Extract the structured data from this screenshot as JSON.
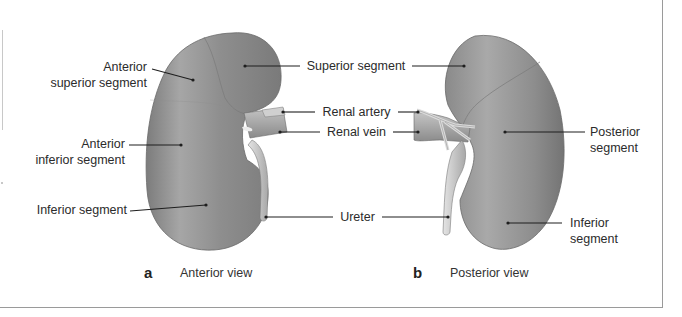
{
  "figure": {
    "colors": {
      "kidney_fill": "#8f8f8f",
      "kidney_light": "#b9b9b9",
      "kidney_dark": "#6e6e6e",
      "vessel_fill": "#a8a8a8",
      "ureter_fill": "#d2d2d2",
      "leader_line": "#1e1e1e",
      "text": "#2b2b2b",
      "border": "#9a9a9a"
    },
    "panels": [
      {
        "letter": "a",
        "caption": "Anterior view",
        "labels": {
          "anterior_superior_1": "Anterior",
          "anterior_superior_2": "superior segment",
          "anterior_inferior_1": "Anterior",
          "anterior_inferior_2": "inferior segment",
          "inferior": "Inferior segment"
        }
      },
      {
        "letter": "b",
        "caption": "Posterior view",
        "labels": {
          "posterior_1": "Posterior",
          "posterior_2": "segment",
          "inferior_1": "Inferior",
          "inferior_2": "segment"
        }
      }
    ],
    "shared_labels": {
      "superior_segment": "Superior segment",
      "renal_artery": "Renal artery",
      "renal_vein": "Renal vein",
      "ureter": "Ureter"
    }
  }
}
